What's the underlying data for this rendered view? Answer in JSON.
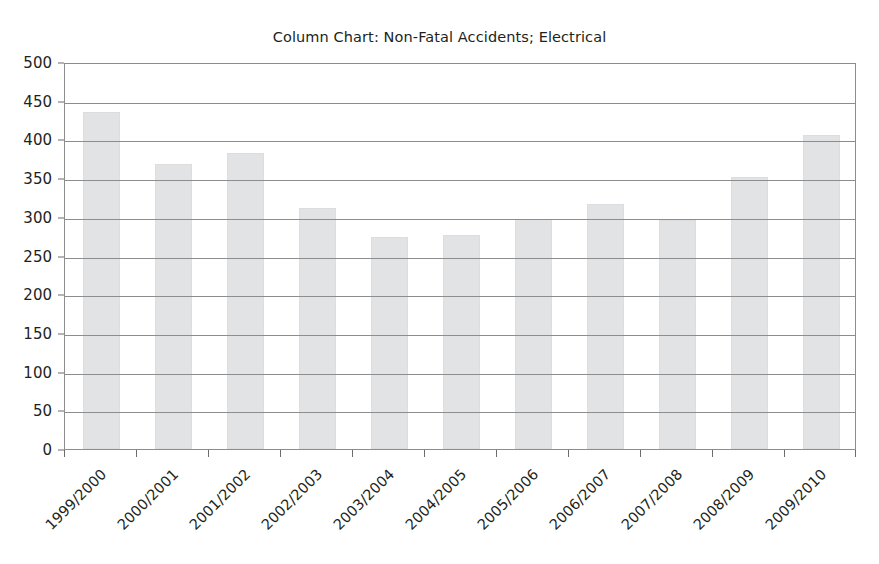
{
  "chart_data": {
    "type": "bar",
    "title": "Column Chart: Non-Fatal Accidents; Electrical",
    "xlabel": "",
    "ylabel": "",
    "ylim": [
      0,
      500
    ],
    "ytick_step": 50,
    "grid": true,
    "legend": "none",
    "bar_color": "#e2e3e4",
    "bar_border_color": "#dcdddf",
    "axis_color": "#8d8d8d",
    "text_color": "#231f20",
    "xtick_rotation": -45,
    "categories": [
      "1999/2000",
      "2000/2001",
      "2001/2002",
      "2002/2003",
      "2003/2004",
      "2004/2005",
      "2005/2006",
      "2006/2007",
      "2007/2008",
      "2008/2009",
      "2009/2010"
    ],
    "values": [
      435,
      368,
      382,
      311,
      274,
      277,
      297,
      316,
      296,
      351,
      406
    ],
    "ytick_labels": [
      "0",
      "50",
      "100",
      "150",
      "200",
      "250",
      "300",
      "350",
      "400",
      "450",
      "500"
    ],
    "ytick_values": [
      0,
      50,
      100,
      150,
      200,
      250,
      300,
      350,
      400,
      450,
      500
    ]
  }
}
